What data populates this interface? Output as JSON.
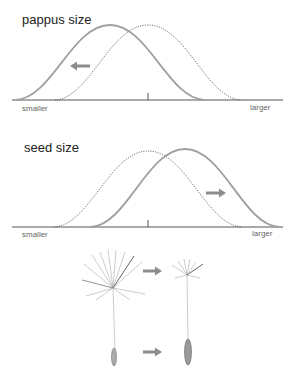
{
  "panels": [
    {
      "title": "pappus size",
      "axis_left": "smaller",
      "axis_right": "larger",
      "shift": "left",
      "curves": [
        {
          "name": "original",
          "style": "dotted",
          "peak_x": 148
        },
        {
          "name": "shifted",
          "style": "solid",
          "peak_x": 110
        }
      ]
    },
    {
      "title": "seed size",
      "axis_left": "smaller",
      "axis_right": "larger",
      "shift": "right",
      "curves": [
        {
          "name": "original",
          "style": "dotted",
          "peak_x": 148
        },
        {
          "name": "shifted",
          "style": "solid",
          "peak_x": 185
        }
      ]
    }
  ],
  "illustration": {
    "description": "dandelion seed with large pappus and small seed shifting to smaller pappus and larger seed",
    "arrows": 2
  },
  "colors": {
    "solid_curve": "#9a9a9a",
    "dotted_curve": "#555555",
    "axis": "#555555",
    "arrow": "#8c8c8c"
  }
}
